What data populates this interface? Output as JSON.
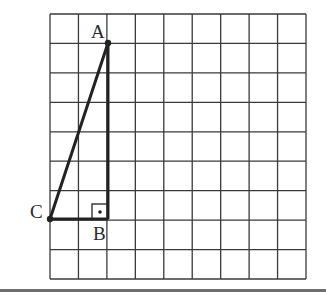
{
  "diagram": {
    "type": "right-triangle-on-grid",
    "grid": {
      "columns": 9,
      "rows": 9,
      "line_color": "#3a3a3a"
    },
    "triangle": {
      "stroke_color": "#222222",
      "vertices": [
        {
          "label": "A",
          "col": 2,
          "row": 1
        },
        {
          "label": "B",
          "col": 2,
          "row": 7
        },
        {
          "label": "C",
          "col": 0,
          "row": 7
        }
      ],
      "right_angle_at": "B"
    },
    "labels": {
      "a": "A",
      "b": "B",
      "c": "C"
    }
  }
}
